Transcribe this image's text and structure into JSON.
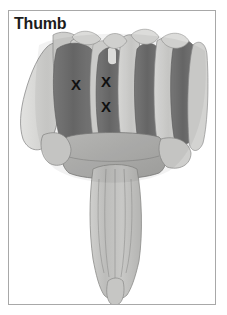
{
  "figure": {
    "title_label": "Thumb",
    "view": "dorsal-hand-forearm",
    "frame_color": "#a8a8a8",
    "background_color": "#ffffff"
  },
  "markers": {
    "symbol": "X",
    "items": [
      {
        "id": "marker-1",
        "label": "X",
        "x": 76,
        "y": 84
      },
      {
        "id": "marker-2",
        "label": "X",
        "x": 106,
        "y": 81
      },
      {
        "id": "marker-3",
        "label": "X",
        "x": 106,
        "y": 106
      }
    ]
  },
  "palette": {
    "muscle_dark": "#6f6f6f",
    "muscle_mid": "#8e8e8e",
    "bone_light": "#c9c9c7",
    "bone_pale": "#dedede",
    "outline": "#6a6a6a",
    "label_text": "#1c1c1c"
  }
}
